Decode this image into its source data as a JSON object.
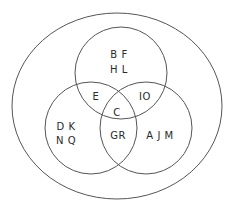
{
  "diagram": {
    "type": "venn",
    "universe": {
      "name": "outer-set"
    },
    "sets": [
      {
        "name": "top",
        "label": ""
      },
      {
        "name": "left",
        "label": ""
      },
      {
        "name": "right",
        "label": ""
      }
    ],
    "regions": {
      "top_only": {
        "line1": "B F",
        "line2": "H L"
      },
      "left_only": {
        "line1": "D K",
        "line2": "N Q"
      },
      "right_only": {
        "text": "A J M"
      },
      "top_left": {
        "text": "E"
      },
      "top_right": {
        "text": "IO"
      },
      "left_right": {
        "text": "GR"
      },
      "all_three": {
        "text": "C"
      }
    },
    "colors": {
      "stroke": "#555555",
      "text": "#2a2a2a",
      "background": "#ffffff"
    }
  }
}
